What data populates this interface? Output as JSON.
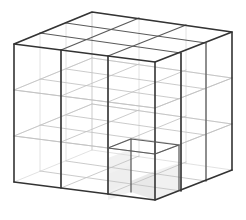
{
  "figure": {
    "kind": "wireframe-cube",
    "background_color": "#ffffff",
    "projection": "oblique-perspective",
    "divisions": 3,
    "cell_count": 27,
    "colors": {
      "outer_edge": "#333333",
      "silhouette_edge": "#5a5a5a",
      "inner_grid": "#c2c2c2",
      "inner_grid_far": "#d8d8d8",
      "shaded_face": "#e2e2e2",
      "shaded_face_soft": "#ededed"
    },
    "vertices": {
      "top_left": [
        14,
        44
      ],
      "top_back": [
        92,
        12
      ],
      "top_right": [
        232,
        32
      ],
      "top_front": [
        155,
        62
      ],
      "bottom_left": [
        14,
        182
      ],
      "bottom_front": [
        155,
        200
      ],
      "bottom_right": [
        232,
        170
      ],
      "bottom_back": [
        92,
        150
      ]
    },
    "labels": {
      "top_face": "top-face",
      "left_face": "left-face",
      "right_face": "right-face",
      "inner_cell": "highlighted-inner-cell"
    }
  }
}
